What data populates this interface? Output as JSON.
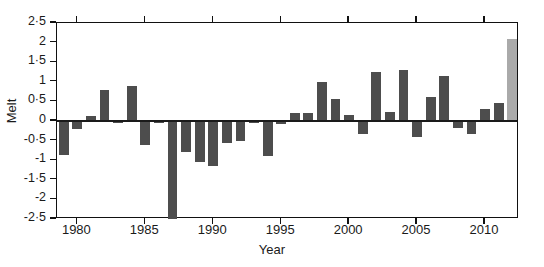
{
  "figure": {
    "title_fragment": "",
    "axis_y_label": "Melt",
    "axis_x_label": "Year"
  },
  "colors": {
    "bar": "#4d4d4d",
    "highlight_bar": "#aaaaaa",
    "axis": "#111111",
    "background": "#ffffff"
  },
  "chart_data": {
    "type": "bar",
    "title": "",
    "xlabel": "Year",
    "ylabel": "Melt",
    "xlim": [
      1978.4,
      1912.6
    ],
    "ylim": [
      -2.5,
      2.5
    ],
    "grid": false,
    "legend": false,
    "y_ticks": [
      "2·5",
      "2",
      "1·5",
      "1",
      "0·5",
      "0",
      "-0·5",
      "-1",
      "-1·5",
      "-2",
      "-2·5"
    ],
    "y_tick_values": [
      2.5,
      2,
      1.5,
      1,
      0.5,
      0,
      -0.5,
      -1,
      -1.5,
      -2,
      -2.5
    ],
    "x_ticks": [
      "1980",
      "1985",
      "1990",
      "1995",
      "2000",
      "2005",
      "2010"
    ],
    "x_tick_values": [
      1980,
      1985,
      1990,
      1995,
      2000,
      2005,
      2010
    ],
    "categories": [
      1979,
      1980,
      1981,
      1982,
      1983,
      1984,
      1985,
      1986,
      1987,
      1988,
      1989,
      1990,
      1991,
      1992,
      1993,
      1994,
      1995,
      1996,
      1997,
      1998,
      1999,
      2000,
      2001,
      2002,
      2003,
      2004,
      2005,
      2006,
      2007,
      2008,
      2009,
      2010,
      2011,
      2012
    ],
    "values": [
      -0.88,
      -0.2,
      0.12,
      0.78,
      -0.06,
      0.9,
      -0.6,
      -0.05,
      -2.6,
      -0.78,
      -1.05,
      -1.15,
      -0.55,
      -0.5,
      -0.05,
      -0.9,
      -0.08,
      0.2,
      0.2,
      1.0,
      0.55,
      0.15,
      -0.33,
      1.25,
      0.22,
      1.3,
      -0.42,
      0.62,
      1.15,
      -0.18,
      -0.32,
      0.3,
      0.45,
      2.1
    ],
    "highlight_index": 33,
    "highlight_note": "final year bar rendered in light grey",
    "clipped_bars": [
      {
        "year": 1987,
        "note": "extends below axis minimum -2.5"
      }
    ]
  }
}
